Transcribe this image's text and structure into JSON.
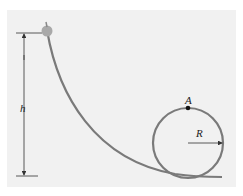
{
  "diagram": {
    "type": "loop-the-loop track",
    "labels": {
      "height": "h",
      "point": "A",
      "radius": "R"
    },
    "colors": {
      "background": "#f1f1f1",
      "track": "#7a7a7a",
      "ball": "#a9a9a9",
      "point": "#111111",
      "lines": "#333333"
    }
  }
}
